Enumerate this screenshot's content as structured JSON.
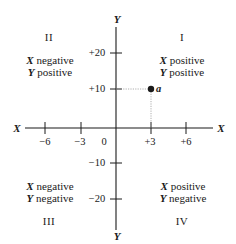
{
  "diagram": {
    "x_axis": {
      "name_left": "X",
      "name_right": "X",
      "ticks": [
        {
          "value": -6,
          "label": "−6"
        },
        {
          "value": -3,
          "label": "−3"
        },
        {
          "value": 3,
          "label": "+3"
        },
        {
          "value": 6,
          "label": "+6"
        }
      ],
      "origin_label": "0"
    },
    "y_axis": {
      "name_top": "Y",
      "name_bottom": "Y",
      "ticks": [
        {
          "value": 20,
          "label": "+20"
        },
        {
          "value": 10,
          "label": "+10"
        },
        {
          "value": -10,
          "label": "−10"
        },
        {
          "value": -20,
          "label": "−20"
        }
      ]
    },
    "quadrants": [
      {
        "id": "I",
        "numeral": "I",
        "x_var": "X",
        "x_sign": "positive",
        "y_var": "Y",
        "y_sign": "positive"
      },
      {
        "id": "II",
        "numeral": "II",
        "x_var": "X",
        "x_sign": "negative",
        "y_var": "Y",
        "y_sign": "positive"
      },
      {
        "id": "III",
        "numeral": "III",
        "x_var": "X",
        "x_sign": "negative",
        "y_var": "Y",
        "y_sign": "negative"
      },
      {
        "id": "IV",
        "numeral": "IV",
        "x_var": "X",
        "x_sign": "positive",
        "y_var": "Y",
        "y_sign": "negative"
      }
    ],
    "point": {
      "label": "a",
      "x": 3,
      "y": 10
    },
    "colors": {
      "ink": "#1a1a1a",
      "guide": "#9a9a9a",
      "background": "#ffffff"
    }
  }
}
